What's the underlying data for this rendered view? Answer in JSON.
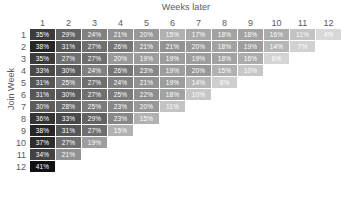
{
  "chart_data": {
    "type": "heatmap",
    "title": "",
    "xlabel": "Weeks later",
    "ylabel": "Join Week",
    "x_tick_labels": [
      "1",
      "2",
      "3",
      "4",
      "5",
      "6",
      "7",
      "8",
      "9",
      "10",
      "11",
      "12"
    ],
    "y_tick_labels": [
      "1",
      "2",
      "3",
      "4",
      "5",
      "6",
      "7",
      "8",
      "9",
      "10",
      "11",
      "12"
    ],
    "value_suffix": "%",
    "grid": false,
    "legend": "none",
    "colorscale": "grayscale-dark-high",
    "value_range": [
      4,
      41
    ],
    "color_min_hex": "#d8d8d8",
    "color_max_hex": "#111111",
    "rows": [
      {
        "label": "1",
        "values": [
          35,
          29,
          24,
          21,
          20,
          15,
          17,
          18,
          18,
          16,
          11,
          4
        ]
      },
      {
        "label": "2",
        "values": [
          38,
          31,
          27,
          26,
          21,
          21,
          20,
          18,
          19,
          14,
          7,
          null
        ]
      },
      {
        "label": "3",
        "values": [
          35,
          27,
          27,
          20,
          19,
          19,
          19,
          18,
          16,
          6,
          null,
          null
        ]
      },
      {
        "label": "4",
        "values": [
          33,
          30,
          24,
          26,
          23,
          19,
          20,
          15,
          10,
          null,
          null,
          null
        ]
      },
      {
        "label": "5",
        "values": [
          31,
          25,
          27,
          24,
          21,
          19,
          14,
          8,
          null,
          null,
          null,
          null
        ]
      },
      {
        "label": "6",
        "values": [
          31,
          30,
          27,
          25,
          22,
          18,
          10,
          null,
          null,
          null,
          null,
          null
        ]
      },
      {
        "label": "7",
        "values": [
          30,
          28,
          25,
          23,
          20,
          11,
          null,
          null,
          null,
          null,
          null,
          null
        ]
      },
      {
        "label": "8",
        "values": [
          36,
          33,
          29,
          23,
          15,
          null,
          null,
          null,
          null,
          null,
          null,
          null
        ]
      },
      {
        "label": "9",
        "values": [
          38,
          31,
          27,
          15,
          null,
          null,
          null,
          null,
          null,
          null,
          null,
          null
        ]
      },
      {
        "label": "10",
        "values": [
          37,
          27,
          19,
          null,
          null,
          null,
          null,
          null,
          null,
          null,
          null,
          null
        ]
      },
      {
        "label": "11",
        "values": [
          34,
          21,
          null,
          null,
          null,
          null,
          null,
          null,
          null,
          null,
          null,
          null
        ]
      },
      {
        "label": "12",
        "values": [
          41,
          null,
          null,
          null,
          null,
          null,
          null,
          null,
          null,
          null,
          null,
          null
        ]
      }
    ]
  }
}
